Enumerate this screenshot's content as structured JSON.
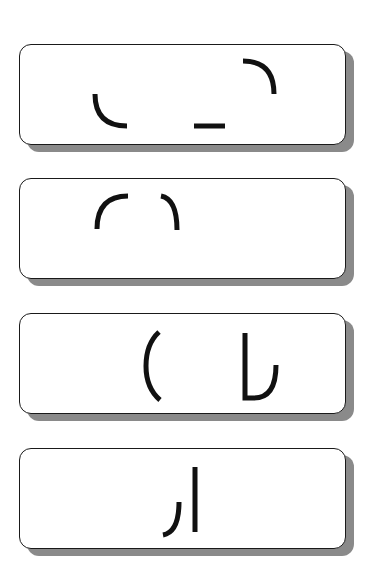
{
  "cards": [
    {
      "index": 1,
      "top": 44,
      "fragments": [
        {
          "name": "bottom-left-arc",
          "d": "M 94 49 Q 94 81 126 81"
        },
        {
          "name": "horizontal-dash",
          "d": "M 193 81 L 224 81"
        },
        {
          "name": "top-right-arc",
          "d": "M 242 16 Q 273 16 273 49"
        }
      ]
    },
    {
      "index": 2,
      "top": 178,
      "fragments": [
        {
          "name": "left-arc",
          "d": "M 96 50 Q 96 17 127 17"
        },
        {
          "name": "right-arc",
          "d": "M 160 17 Q 176 20 176 51"
        }
      ]
    },
    {
      "index": 3,
      "top": 313,
      "fragments": [
        {
          "name": "left-paren",
          "d": "M 158 18 Q 145 30 145 52 Q 145 74 159 86"
        },
        {
          "name": "hook-shape",
          "d": "M 244 19 L 244 84 L 253 84 Q 275 84 275 51"
        }
      ]
    },
    {
      "index": 4,
      "top": 448,
      "fragments": [
        {
          "name": "left-hook",
          "d": "M 178 53 Q 178 83 162 86"
        },
        {
          "name": "vertical-line",
          "d": "M 194 18 L 194 83"
        }
      ]
    }
  ],
  "colors": {
    "background": "#ffffff",
    "card_fill": "#ffffff",
    "card_border": "#1a1a1a",
    "shadow": "#8a8a8a",
    "stroke": "#111111"
  }
}
